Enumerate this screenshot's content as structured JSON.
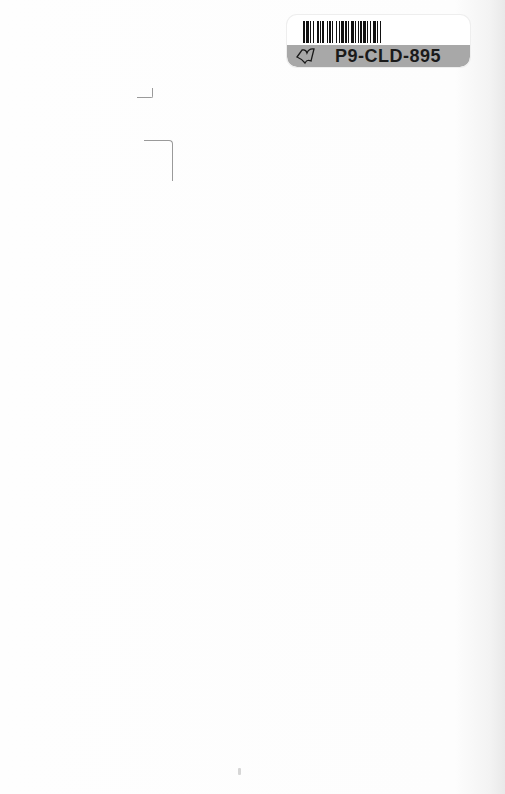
{
  "page": {
    "type": "blank book endpaper scan",
    "background_color": "#fdfdfd"
  },
  "barcode_label": {
    "code": "P9-CLD-895",
    "icon": "book-icon",
    "band_color": "#a8a8a8",
    "bar_color": "#111111"
  },
  "marks": [
    {
      "name": "pencil-mark-corner-bottom-right"
    },
    {
      "name": "pencil-mark-corner-top-right"
    }
  ]
}
